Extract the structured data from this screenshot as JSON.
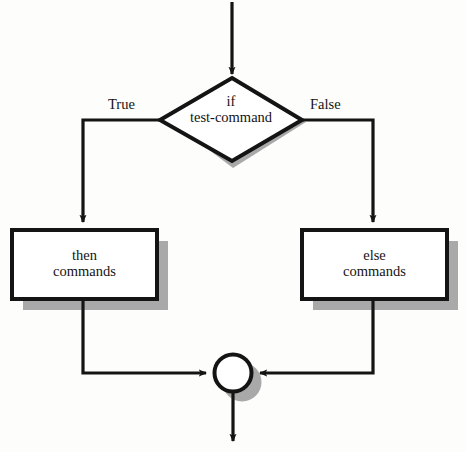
{
  "diagram": {
    "type": "flowchart",
    "colors": {
      "background": "#fdfdfb",
      "stroke": "#141414",
      "shadow": "#a9a9a9",
      "fill": "#ffffff"
    },
    "nodes": {
      "decision": {
        "shape": "diamond",
        "line1": "if",
        "line2": "test-command",
        "text": "if\ntest-command"
      },
      "then_box": {
        "shape": "rectangle",
        "line1": "then",
        "line2": "commands",
        "text": "then\ncommands"
      },
      "else_box": {
        "shape": "rectangle",
        "line1": "else",
        "line2": "commands",
        "text": "else\ncommands"
      },
      "merge": {
        "shape": "circle",
        "text": ""
      }
    },
    "edges": {
      "true_label": "True",
      "false_label": "False",
      "entry": "input-arrow",
      "exit": "output-arrow"
    }
  }
}
